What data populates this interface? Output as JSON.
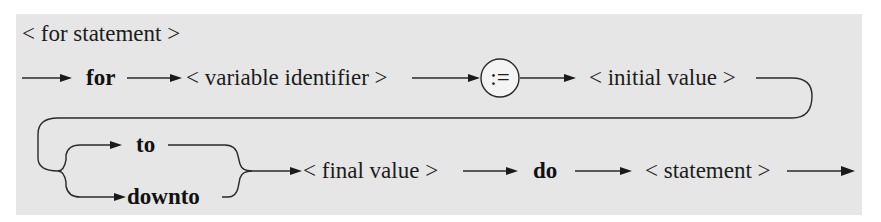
{
  "diagram": {
    "type": "syntax-diagram",
    "title": "< for statement >",
    "row1": {
      "keyword_for": "for",
      "variable_identifier": "< variable identifier >",
      "assign_symbol": ":=",
      "initial_value": "< initial value >"
    },
    "row2": {
      "keyword_to": "to",
      "keyword_downto": "downto",
      "final_value": "< final value >",
      "keyword_do": "do",
      "statement": "< statement >"
    },
    "colors": {
      "background": "#e6e6e6",
      "line": "#2a2a2a",
      "text": "#1c1c1c"
    }
  }
}
